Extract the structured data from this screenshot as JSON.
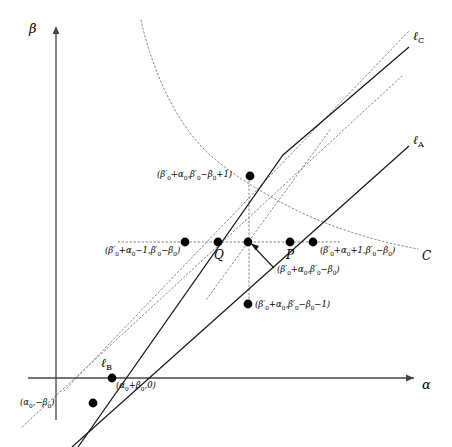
{
  "figure": {
    "type": "geometric-diagram",
    "width": 452,
    "height": 447,
    "background": "#ffffff",
    "stroke_solid": "#1a1a1a",
    "stroke_dotted": "#6b6b6b",
    "dot_color": "#000000"
  },
  "axes": {
    "x_label": "α",
    "y_label": "β",
    "origin": {
      "x": 56,
      "y": 378
    },
    "x_axis": {
      "x1": 28,
      "y1": 378,
      "x2": 418,
      "y2": 378
    },
    "y_axis": {
      "x1": 56,
      "y1": 420,
      "x2": 56,
      "y2": 26
    }
  },
  "lines": [
    {
      "name": "ell_A",
      "label": "ℓ",
      "subscript": "A",
      "label_x": 413,
      "label_y": 140
    },
    {
      "name": "ell_B",
      "label": "ℓ",
      "subscript": "B",
      "label_x": 103,
      "label_y": 363
    },
    {
      "name": "ell_C",
      "label": "ℓ",
      "subscript": "C",
      "label_x": 413,
      "label_y": 36
    }
  ],
  "curve": {
    "name": "C",
    "label": "C",
    "label_x": 422,
    "label_y": 256
  },
  "points": [
    {
      "id": "p-upper",
      "x": 250,
      "y": 176,
      "label_html": "(β′<sub>0</sub><span class=\"op\">+</span>α<sub>0</sub>,β′<sub>0</sub><span class=\"op\">−</span>β<sub>0</sub><span class=\"op\">+</span>1)",
      "label_x": 157,
      "label_y": 170,
      "label_align": "left"
    },
    {
      "id": "p-left-outer",
      "x": 185,
      "y": 242,
      "label_html": "(β′<sub>0</sub><span class=\"op\">+</span>α<sub>0</sub><span class=\"op\">−</span>1,β′<sub>0</sub><span class=\"op\">−</span>β<sub>0</sub>)",
      "label_x": 105,
      "label_y": 247,
      "label_align": "left"
    },
    {
      "id": "point-Q",
      "x": 218,
      "y": 242,
      "label_html": "Q",
      "label_x": 214,
      "label_y": 251,
      "label_align": "left"
    },
    {
      "id": "p-center",
      "x": 248,
      "y": 242,
      "label_html": "(β′<sub>0</sub><span class=\"op\">+</span>α<sub>0</sub>,β′<sub>0</sub><span class=\"op\">−</span>β<sub>0</sub>)",
      "label_x": 277,
      "label_y": 266,
      "label_align": "left"
    },
    {
      "id": "point-P",
      "x": 290,
      "y": 242,
      "label_html": "P",
      "label_x": 286,
      "label_y": 251,
      "label_align": "left"
    },
    {
      "id": "p-right-outer",
      "x": 313,
      "y": 242,
      "label_html": "(β′<sub>0</sub><span class=\"op\">+</span>α<sub>0</sub><span class=\"op\">+</span>1,β′<sub>0</sub><span class=\"op\">−</span>β<sub>0</sub>)",
      "label_x": 320,
      "label_y": 247,
      "label_align": "left"
    },
    {
      "id": "p-lower",
      "x": 248,
      "y": 304,
      "label_html": "(β′<sub>0</sub><span class=\"op\">+</span>α<sub>0</sub>,β′<sub>0</sub><span class=\"op\">−</span>β<sub>0</sub><span class=\"op\">−</span>1)",
      "label_x": 255,
      "label_y": 309,
      "label_align": "left"
    },
    {
      "id": "p-axis-intercept",
      "x": 112,
      "y": 378,
      "label_html": "(α<sub>0</sub><span class=\"op\">+</span>β<sub>0</sub>,0)",
      "label_x": 116,
      "label_y": 385,
      "label_align": "left"
    },
    {
      "id": "p-below-axis",
      "x": 93,
      "y": 403,
      "label_html": "(α<sub>0</sub>,<span class=\"op\">−</span>β<sub>0</sub>)",
      "label_x": 20,
      "label_y": 400,
      "label_align": "left"
    }
  ]
}
